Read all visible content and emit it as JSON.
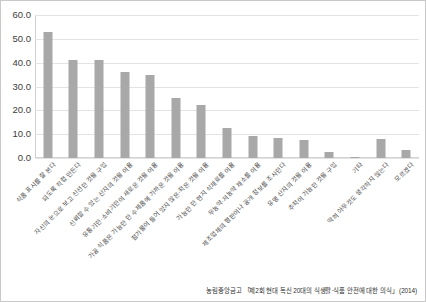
{
  "chart_data": {
    "type": "bar",
    "title": "",
    "subtitle": "",
    "xlabel": "",
    "ylabel": "",
    "ylim": [
      0.0,
      60.0
    ],
    "yticks": [
      "0.0",
      "10.0",
      "20.0",
      "30.0",
      "40.0",
      "50.0",
      "60.0"
    ],
    "ytick_values": [
      0.0,
      10.0,
      20.0,
      30.0,
      40.0,
      50.0,
      60.0
    ],
    "grid": true,
    "legend": "none",
    "bar_color": "#a8a8a8",
    "categories": [
      "식품 표시를 잘 본다",
      "되도록 직접 만든다",
      "자신의 눈으로 보고 신선한 것을 구입",
      "신뢰할 수 있는 산지의 것을 이용",
      "유통기한·소비기한이 새로운 것을 이용",
      "가공 식품은 가능한 한 수제품에 가까운 것을 이용",
      "첨가물이 들어 있지 않은·적은 것을 이용",
      "가능한 한 현지 식재료를 이용",
      "무농약·저농약 채소를 이용",
      "제조업체의 평판이나 공개 정보를 조사한다",
      "유명 산지의 것을 이용",
      "추적이 가능한 것을 구입",
      "기타",
      "딱히 아무것도 생각하지 않는다",
      "모르겠다"
    ],
    "values": [
      52.8,
      41.2,
      41.2,
      36.2,
      34.8,
      25.2,
      22.2,
      12.5,
      9.2,
      8.3,
      7.6,
      2.6,
      0.3,
      8.1,
      3.5
    ],
    "source": "농림중앙금고 「제2회 현대 독신 20대의 식생활·식품 안전에 대한 의식」 (2014)"
  }
}
